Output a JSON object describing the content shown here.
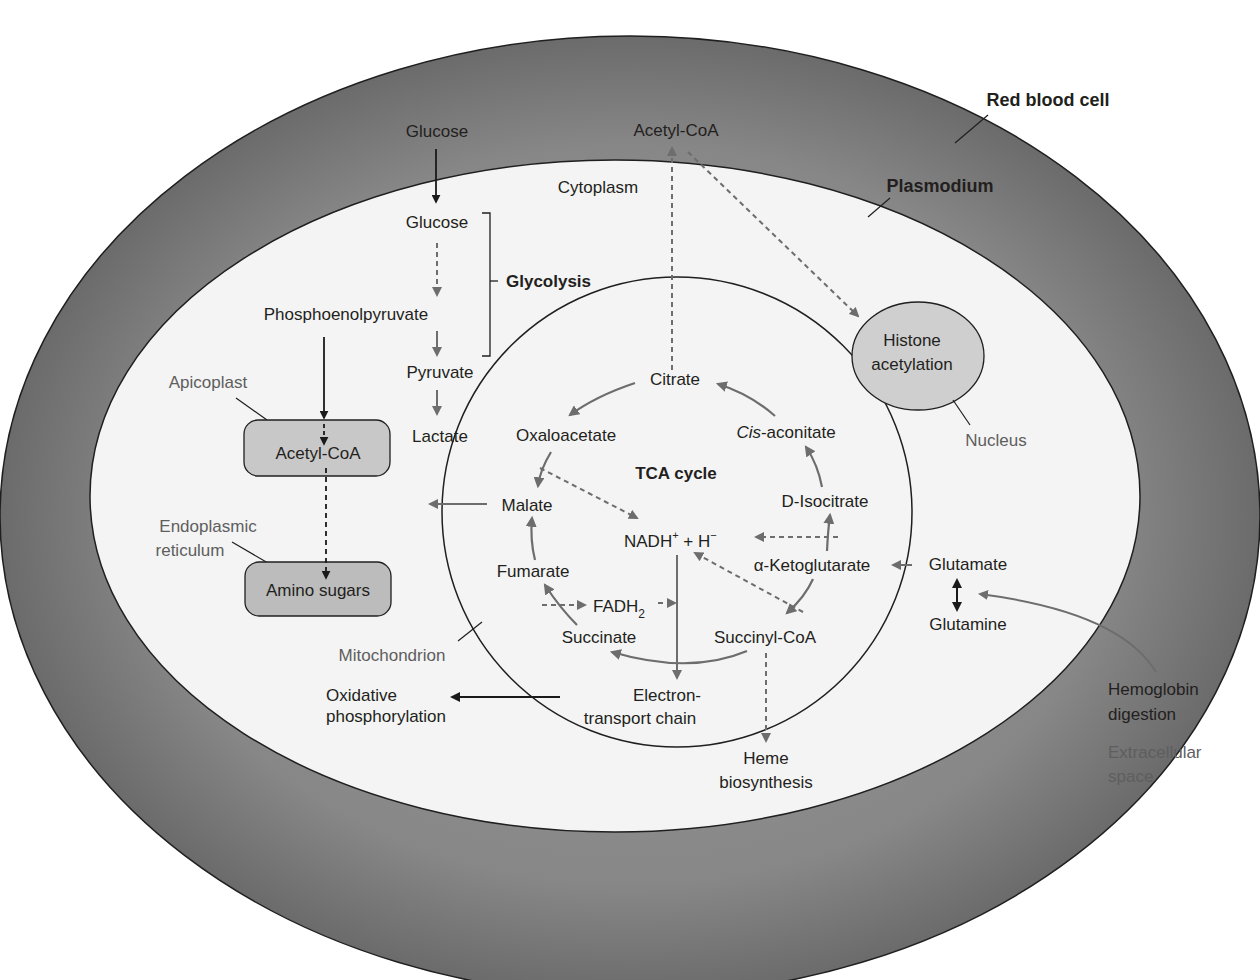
{
  "diagram": {
    "compartments": {
      "red_blood_cell": "Red blood cell",
      "plasmodium": "Plasmodium",
      "cytoplasm": "Cytoplasm",
      "mitochondrion": "Mitochondrion",
      "apicoplast": "Apicoplast",
      "endoplasmic_reticulum_1": "Endoplasmic",
      "endoplasmic_reticulum_2": "reticulum",
      "nucleus": "Nucleus",
      "extracellular_1": "Extracellular",
      "extracellular_2": "space"
    },
    "glycolysis": {
      "glucose_outside": "Glucose",
      "glucose_inside": "Glucose",
      "pep": "Phosphoenolpyruvate",
      "pyruvate": "Pyruvate",
      "lactate": "Lactate",
      "label": "Glycolysis"
    },
    "apicoplast_box": "Acetyl-CoA",
    "er_box": "Amino sugars",
    "acetyl_coa_top": "Acetyl-CoA",
    "nucleus_box": {
      "line1": "Histone",
      "line2": "acetylation"
    },
    "tca": {
      "title": "TCA cycle",
      "citrate": "Citrate",
      "cis_aconitate_italic": "Cis",
      "cis_aconitate_rest": "-aconitate",
      "isocitrate": "D-Isocitrate",
      "akg": "α-Ketoglutarate",
      "succinyl_coa": "Succinyl-CoA",
      "succinate": "Succinate",
      "fumarate": "Fumarate",
      "malate": "Malate",
      "oxaloacetate": "Oxaloacetate",
      "nadh": "NADH",
      "nadh_sup": "+",
      "plus_h": " + H",
      "h_sup": "−",
      "fadh": "FADH",
      "fadh_sub": "2"
    },
    "etc": {
      "line1": "Electron-",
      "line2": "transport chain"
    },
    "oxphos": {
      "line1": "Oxidative",
      "line2": "phosphorylation"
    },
    "heme": {
      "line1": "Heme",
      "line2": "biosynthesis"
    },
    "glutamate": "Glutamate",
    "glutamine": "Glutamine",
    "hemoglobin": {
      "line1": "Hemoglobin",
      "line2": "digestion"
    },
    "colors": {
      "rbc_ring": "#7b7b7b",
      "cytoplasm": "#f4f4f4",
      "box_fill": "#c8c8c8",
      "gray_arrow": "#6d6d6d",
      "black_arrow": "#1a1a1a",
      "text": "#231f20",
      "gray_text": "#5e5e5e"
    }
  }
}
